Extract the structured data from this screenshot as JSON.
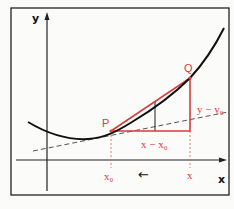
{
  "diagram": {
    "title": "",
    "axes": {
      "x_label": "x",
      "y_label": "y"
    },
    "points": {
      "P": {
        "label": "P"
      },
      "Q": {
        "label": "Q"
      }
    },
    "labels": {
      "x0": "x₀",
      "x": "x",
      "dx": "x − x₀",
      "dy": "y − y₀",
      "arrow": "←"
    },
    "colors": {
      "curve": "#111111",
      "secant_triangle": "#d83c3c",
      "tangent_dashed": "#555555",
      "frame": "#222222",
      "background": "#fbfbf9"
    }
  }
}
